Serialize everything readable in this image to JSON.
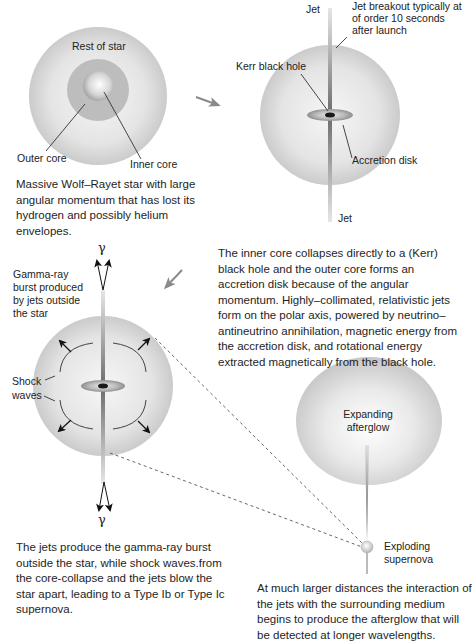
{
  "panel1": {
    "labels": {
      "rest_of_star": "Rest of star",
      "outer_core": "Outer core",
      "inner_core": "Inner core"
    },
    "caption": "Massive Wolf–Rayet star with large angular momentum that has lost its hydrogen and possibly helium envelopes."
  },
  "panel2": {
    "labels": {
      "jet_top": "Jet",
      "jet_bottom": "Jet",
      "jet_breakout": "Jet breakout typically at of order 10 seconds after launch",
      "kerr_black_hole": "Kerr black hole",
      "accretion_disk": "Accretion disk"
    },
    "caption": "The inner core collapses directly to a (Kerr) black hole and the outer core forms an accretion disk because of the angular momentum. Highly–collimated, relativistic jets form on the polar axis, powered by neutrino–antineutrino annihilation, magnetic energy from the accretion disk, and rotational energy extracted magnetically from the black hole."
  },
  "panel3": {
    "labels": {
      "gamma_top": "γ",
      "gamma_bottom": "γ",
      "grb": "Gamma-ray burst produced by jets outside the star",
      "shock_waves": "Shock waves"
    },
    "caption": "The jets produce the gamma-ray burst outside the star, while shock waves.from the core-collapse and the jets blow the star apart, leading to a Type Ib or Type Ic supernova."
  },
  "panel4": {
    "labels": {
      "expanding_afterglow": "Expanding afterglow",
      "exploding_supernova": "Exploding supernova"
    },
    "caption": "At much larger distances the interaction of the jets with the surrounding medium begins to produce the afterglow that will be detected at longer wavelengths."
  },
  "colors": {
    "star_edge": "#c8c8c8",
    "star_center": "#f4f4f4",
    "outer_core": "#bdbdbd",
    "jet": "#7a7a7a",
    "arrow": "#8a8a8a",
    "text": "#222222"
  }
}
